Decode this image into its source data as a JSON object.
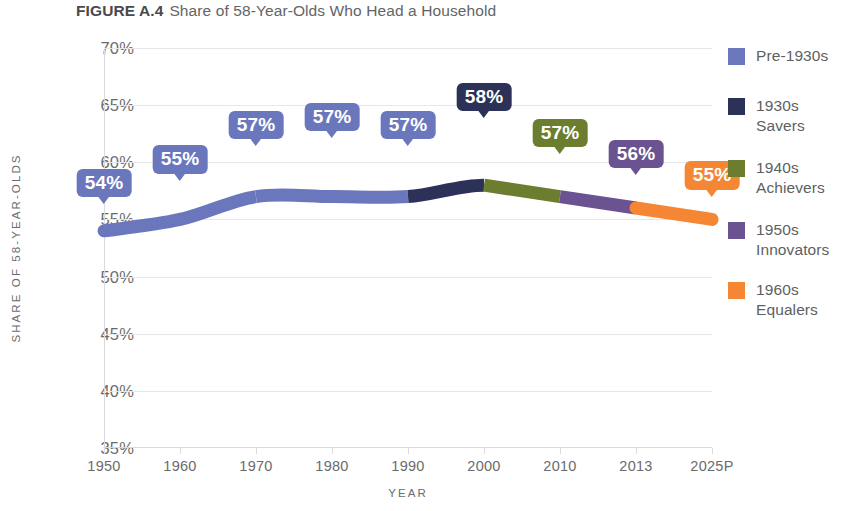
{
  "title": {
    "label": "FIGURE A.4",
    "caption": "Share of 58-Year-Olds Who Head a Household"
  },
  "chart_data": {
    "type": "line",
    "title": "Share of 58-Year-Olds Who Head a Household",
    "xlabel": "YEAR",
    "ylabel": "SHARE OF 58-YEAR-OLDS",
    "categories": [
      "1950",
      "1960",
      "1970",
      "1980",
      "1990",
      "2000",
      "2010",
      "2013",
      "2025P"
    ],
    "values": [
      54,
      55,
      57,
      57,
      57,
      58,
      57,
      56,
      55
    ],
    "point_labels": [
      "54%",
      "55%",
      "57%",
      "57%",
      "57%",
      "58%",
      "57%",
      "56%",
      "55%"
    ],
    "ylim": [
      35,
      70
    ],
    "yticks": [
      70,
      65,
      60,
      55,
      50,
      45,
      40,
      35
    ],
    "ytick_labels": [
      "70%",
      "65%",
      "60%",
      "55%",
      "50%",
      "45%",
      "40%",
      "35%"
    ],
    "grid": true,
    "legend_position": "right",
    "series": [
      {
        "name": "Pre-1930s",
        "color": "#6b77bd",
        "segment_start": "1950",
        "segment_end": "1990"
      },
      {
        "name": "1930s Savers",
        "color": "#2b3157",
        "segment_start": "1990",
        "segment_end": "2000"
      },
      {
        "name": "1940s Achievers",
        "color": "#6c7d30",
        "segment_start": "2000",
        "segment_end": "2010"
      },
      {
        "name": "1950s Innovators",
        "color": "#6b5291",
        "segment_start": "2010",
        "segment_end": "2013"
      },
      {
        "name": "1960s Equalers",
        "color": "#f58634",
        "segment_start": "2013",
        "segment_end": "2025P"
      }
    ],
    "point_label_colors": [
      "#6b77bd",
      "#6b77bd",
      "#6b77bd",
      "#6b77bd",
      "#6b77bd",
      "#2b3157",
      "#6c7d30",
      "#6b5291",
      "#f58634"
    ]
  },
  "legend": {
    "items": [
      {
        "label": "Pre-1930s",
        "color": "#6b77bd"
      },
      {
        "label": "1930s\nSavers",
        "color": "#2b3157"
      },
      {
        "label": "1940s\nAchievers",
        "color": "#6c7d30"
      },
      {
        "label": "1950s\nInnovators",
        "color": "#6b5291"
      },
      {
        "label": "1960s\nEqualers",
        "color": "#f58634"
      }
    ]
  }
}
